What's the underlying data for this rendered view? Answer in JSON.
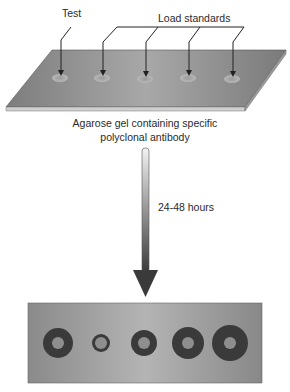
{
  "labels": {
    "test": "Test",
    "load_standards": "Load standards",
    "gel_caption_line1": "Agarose gel containing specific",
    "gel_caption_line2": "polyclonal antibody",
    "time": "24-48 hours"
  },
  "top_gel": {
    "wells": [
      {
        "name": "test",
        "cx": 60
      },
      {
        "name": "standard-1",
        "cx": 102
      },
      {
        "name": "standard-2",
        "cx": 145
      },
      {
        "name": "standard-3",
        "cx": 188
      },
      {
        "name": "standard-4",
        "cx": 232
      }
    ],
    "color": "#8a8a8a"
  },
  "bottom_gel": {
    "rings": [
      {
        "name": "test",
        "cx": 58,
        "outer_r": 15,
        "inner_r": 6
      },
      {
        "name": "standard-1",
        "cx": 101,
        "outer_r": 9,
        "inner_r": 6
      },
      {
        "name": "standard-2",
        "cx": 144,
        "outer_r": 13,
        "inner_r": 6
      },
      {
        "name": "standard-3",
        "cx": 188,
        "outer_r": 16,
        "inner_r": 6
      },
      {
        "name": "standard-4",
        "cx": 230,
        "outer_r": 18,
        "inner_r": 6
      }
    ],
    "ring_color": "#3a3a3a",
    "center_color": "#8e8e8e"
  }
}
